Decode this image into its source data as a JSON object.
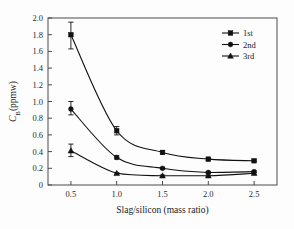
{
  "chart_data": {
    "type": "line",
    "title": "",
    "xlabel": "Slag/silicon (mass ratio)",
    "ylabel": "C_B(ppmw)",
    "ylabel_main": "C",
    "ylabel_sub": "B",
    "ylabel_tail": "(ppmw)",
    "x": [
      0.5,
      1.0,
      1.5,
      2.0,
      2.5
    ],
    "xlim": [
      0.25,
      2.75
    ],
    "ylim": [
      0,
      2.0
    ],
    "xticks": [
      "0.5",
      "1.0",
      "1.5",
      "2.0",
      "2.5"
    ],
    "yticks": [
      "0",
      "0.2",
      "0.4",
      "0.6",
      "0.8",
      "1.0",
      "1.2",
      "1.4",
      "1.6",
      "1.8",
      "2.0"
    ],
    "grid": false,
    "legend_position": "top-right",
    "series": [
      {
        "name": "1st",
        "marker": "square",
        "values": [
          1.8,
          0.65,
          0.39,
          0.31,
          0.29
        ],
        "err_low": [
          1.63,
          0.6,
          0.37,
          0.29,
          0.28
        ],
        "err_high": [
          1.95,
          0.7,
          0.41,
          0.32,
          0.3
        ]
      },
      {
        "name": "2nd",
        "marker": "circle",
        "values": [
          0.91,
          0.33,
          0.2,
          0.15,
          0.16
        ],
        "err_low": [
          0.84,
          0.31,
          0.19,
          0.14,
          0.15
        ],
        "err_high": [
          1.0,
          0.35,
          0.21,
          0.16,
          0.17
        ]
      },
      {
        "name": "3rd",
        "marker": "triangle",
        "values": [
          0.41,
          0.14,
          0.11,
          0.11,
          0.14
        ],
        "err_low": [
          0.34,
          0.13,
          0.1,
          0.1,
          0.13
        ],
        "err_high": [
          0.49,
          0.15,
          0.12,
          0.12,
          0.15
        ]
      }
    ],
    "colors": {
      "line": "#111111",
      "axis": "#4a4a4a",
      "background": "#fdfdfd"
    }
  },
  "legend": {
    "entries": [
      {
        "label": "1st"
      },
      {
        "label": "2nd"
      },
      {
        "label": "3rd"
      }
    ]
  }
}
